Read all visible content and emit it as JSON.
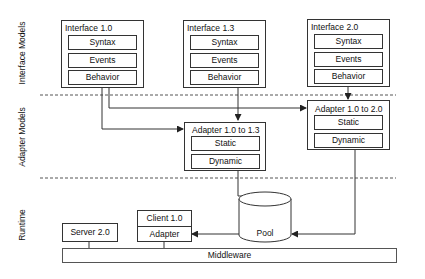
{
  "layers": [
    {
      "id": "interface-models",
      "label": "Interface Models"
    },
    {
      "id": "adapter-models",
      "label": "Adapter Models"
    },
    {
      "id": "runtime",
      "label": "Runtime"
    }
  ],
  "interfaces": [
    {
      "title": "Interface 1.0",
      "parts": [
        "Syntax",
        "Events",
        "Behavior"
      ]
    },
    {
      "title": "Interface 1.3",
      "parts": [
        "Syntax",
        "Events",
        "Behavior"
      ]
    },
    {
      "title": "Interface 2.0",
      "parts": [
        "Syntax",
        "Events",
        "Behavior"
      ]
    }
  ],
  "adapters": [
    {
      "title": "Adapter 1.0 to 1.3",
      "parts": [
        "Static",
        "Dynamic"
      ]
    },
    {
      "title": "Adapter 1.0 to 2.0",
      "parts": [
        "Static",
        "Dynamic"
      ]
    }
  ],
  "runtime": {
    "pool": "Pool",
    "client": {
      "title": "Client 1.0",
      "part": "Adapter"
    },
    "server": "Server 2.0",
    "middleware": "Middleware"
  },
  "colors": {
    "stroke": "#333333",
    "background": "#ffffff"
  }
}
